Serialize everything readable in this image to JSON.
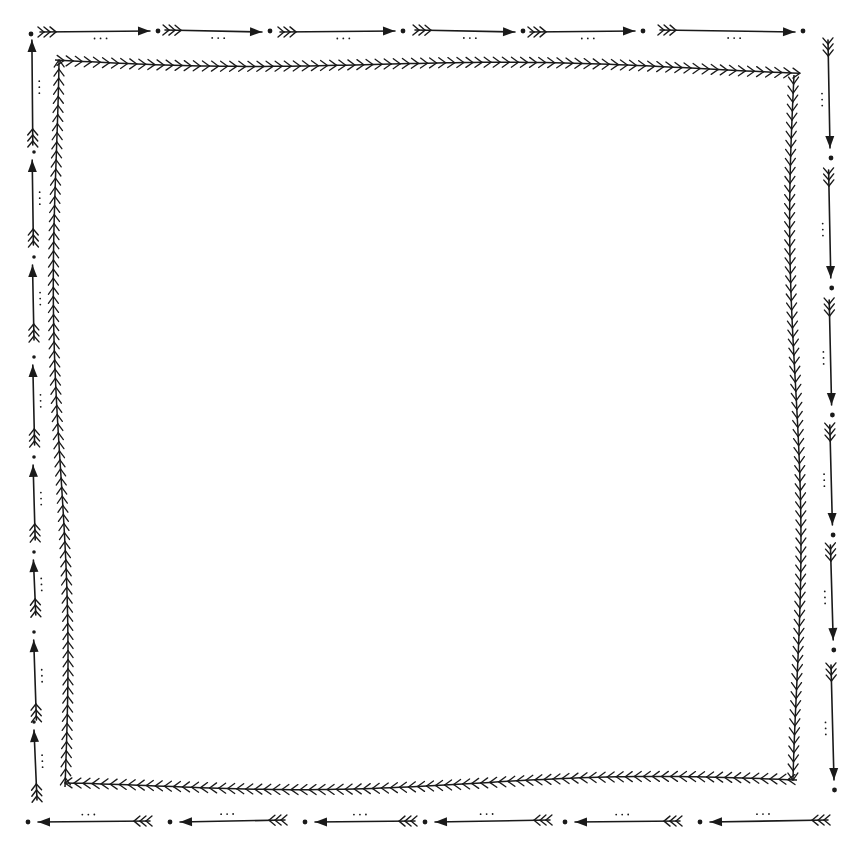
{
  "artwork": {
    "description": "Hand-drawn doodle frame with arrows and herringbone border",
    "background": "#ffffff",
    "ink": "#1a1a1a",
    "outer_border": {
      "style": "arrows with fletching, dots and triple-dot accents, clockwise",
      "top_y": 31,
      "bottom_y": 822,
      "left_x": 31,
      "right_x": 831
    },
    "inner_border": {
      "style": "herringbone / feather stitch",
      "corners": [
        [
          55,
          60
        ],
        [
          800,
          70
        ],
        [
          797,
          780
        ],
        [
          65,
          787
        ]
      ]
    }
  }
}
